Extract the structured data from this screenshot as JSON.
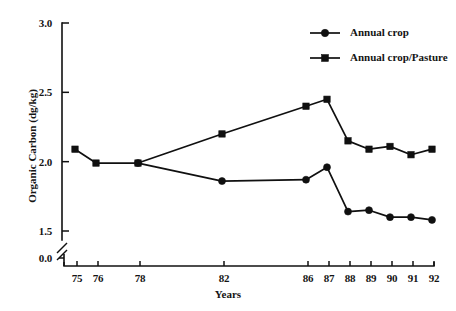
{
  "chart_data": {
    "type": "line",
    "title": "",
    "xlabel": "Years",
    "ylabel": "Organic Carbon (dg/kg)",
    "x": [
      75,
      76,
      78,
      82,
      86,
      87,
      88,
      89,
      90,
      91,
      92
    ],
    "xtick_labels": [
      "75",
      "76",
      "78",
      "82",
      "86",
      "87",
      "88",
      "89",
      "90",
      "91",
      "92"
    ],
    "ytick_labels": [
      "3.0",
      "2.5",
      "2.0",
      "1.5",
      "0.0"
    ],
    "ytick_values": [
      3.0,
      2.5,
      2.0,
      1.5,
      0.0
    ],
    "xlim": [
      74.2,
      92.8
    ],
    "ylim": [
      1.45,
      3.0
    ],
    "y_axis_break": true,
    "y_axis_break_note": "axis break between 1.5 and 0.0",
    "grid": false,
    "legend_position": "top-right",
    "series": [
      {
        "name": "Annual crop",
        "marker": "circle",
        "color": "#101010",
        "x": [
          78,
          82,
          86,
          87,
          88,
          89,
          90,
          91,
          92
        ],
        "values": [
          1.99,
          1.86,
          1.87,
          1.96,
          1.64,
          1.65,
          1.6,
          1.6,
          1.58
        ]
      },
      {
        "name": "Annual crop/Pasture",
        "marker": "square",
        "color": "#101010",
        "x": [
          75,
          76,
          78,
          82,
          86,
          87,
          88,
          89,
          90,
          91,
          92
        ],
        "values": [
          2.09,
          1.99,
          1.99,
          2.2,
          2.4,
          2.45,
          2.15,
          2.09,
          2.11,
          2.05,
          2.09
        ]
      }
    ]
  },
  "legend": {
    "entries": [
      {
        "label": "Annual crop",
        "marker": "circle"
      },
      {
        "label": "Annual crop/Pasture",
        "marker": "square"
      }
    ]
  },
  "axes": {
    "x_title": "Years",
    "y_title": "Organic Carbon (dg/kg)"
  }
}
